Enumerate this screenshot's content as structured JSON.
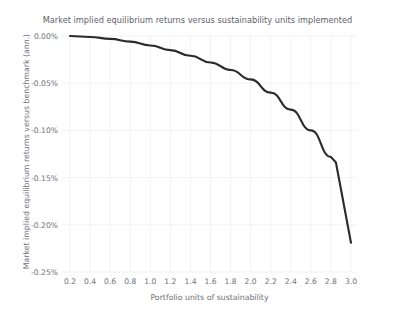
{
  "chart_data": {
    "type": "line",
    "title": "Market implied equilibrium returns versus sustainability units implemented",
    "xlabel": "Portfolio units of sustainability",
    "ylabel": "Market implied equilibrium returns versus benchmark (ann.)",
    "grid": true,
    "legend": false,
    "xlim": [
      0.12,
      3.06
    ],
    "ylim": [
      -0.25,
      0.0
    ],
    "xticks": [
      0.2,
      0.4,
      0.6,
      0.8,
      1.0,
      1.2,
      1.4,
      1.6,
      1.8,
      2.0,
      2.2,
      2.4,
      2.6,
      2.8,
      3.0
    ],
    "xtick_labels": [
      "0.2",
      "0.4",
      "0.6",
      "0.8",
      "1.0",
      "1.2",
      "1.4",
      "1.6",
      "1.8",
      "2.0",
      "2.2",
      "2.4",
      "2.6",
      "2.8",
      "3.0"
    ],
    "yticks": [
      0.0,
      -0.05,
      -0.1,
      -0.15,
      -0.2,
      -0.25
    ],
    "ytick_labels": [
      "0.00%",
      "-0.05%",
      "-0.10%",
      "-0.15%",
      "-0.20%",
      "-0.25%"
    ],
    "y_unit": "%",
    "line_color": "#2b2b2e",
    "grid_color": "#f2f2f3",
    "text_color": "#6e7177",
    "background_color": "#ffffff",
    "series": [
      {
        "name": "Market implied equilibrium return",
        "x": [
          0.2,
          0.4,
          0.6,
          0.8,
          1.0,
          1.2,
          1.4,
          1.6,
          1.8,
          2.0,
          2.2,
          2.4,
          2.6,
          2.8,
          2.85,
          3.0
        ],
        "values": [
          0.0,
          -0.001,
          -0.003,
          -0.006,
          -0.01,
          -0.015,
          -0.021,
          -0.028,
          -0.036,
          -0.046,
          -0.06,
          -0.078,
          -0.1,
          -0.128,
          -0.134,
          -0.219
        ]
      }
    ]
  }
}
